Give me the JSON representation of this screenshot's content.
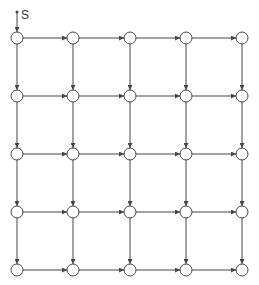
{
  "diagram": {
    "type": "directed-grid-graph",
    "rows": 5,
    "cols": 5,
    "source_label": "S",
    "col_x": [
      17,
      73,
      130,
      186,
      242
    ],
    "row_y": [
      38,
      96,
      154,
      212,
      270
    ],
    "node_radius": 6,
    "edge_directions": [
      "right",
      "down"
    ],
    "stroke_color": "#444444",
    "node_fill": "#ffffff"
  }
}
